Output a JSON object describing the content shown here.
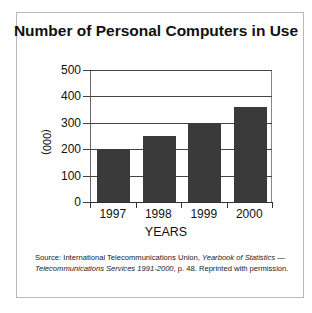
{
  "chart_data": {
    "type": "bar",
    "title": "Number of Personal Computers in Use",
    "xlabel": "YEARS",
    "ylabel": "(000)",
    "categories": [
      "1997",
      "1998",
      "1999",
      "2000"
    ],
    "values": [
      200,
      250,
      300,
      360
    ],
    "ylim": [
      0,
      500
    ],
    "yticks": [
      "0",
      "100",
      "200",
      "300",
      "400",
      "500"
    ],
    "grid": true,
    "legend": null,
    "bar_color": "#3a3a3a"
  },
  "source": {
    "prefix": "Source: International Telecommunications Union,",
    "title_italic": "Yearbook of Statistics — Telecommunications Services 1991-2000",
    "suffix": ", p. 48. Reprinted with permission."
  }
}
